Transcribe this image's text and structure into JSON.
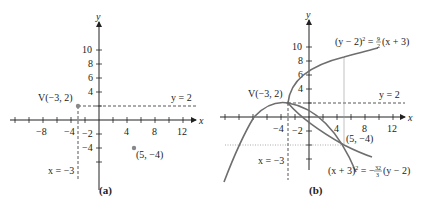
{
  "figure": {
    "panels": [
      {
        "id": "a",
        "caption": "(a)",
        "axis_x_label": "x",
        "axis_y_label": "y",
        "x_ticks": [
          "−8",
          "−4",
          "4",
          "8",
          "12"
        ],
        "y_ticks_pos": [
          "10",
          "8",
          "6",
          "4"
        ],
        "y_ticks_neg": [
          "−2",
          "−4"
        ],
        "vertex_label": "V(−3, 2)",
        "directrix_label": "y = 2",
        "axis_line_label": "x = −3",
        "point_label": "(5, −4)"
      },
      {
        "id": "b",
        "caption": "(b)",
        "axis_x_label": "x",
        "axis_y_label": "y",
        "x_ticks": [
          "−4",
          "4",
          "8",
          "12"
        ],
        "y_ticks_pos": [
          "10",
          "8",
          "6",
          "4"
        ],
        "y_ticks_neg": [
          "−2"
        ],
        "vertex_label": "V(−3, 2)",
        "directrix_label": "y = 2",
        "axis_line_label": "x = −3",
        "point_label": "(5, −4)",
        "eq1": {
          "lhs": "(y − 2)",
          "exp": "2",
          "eq": " = ",
          "num": "9",
          "den": "2",
          "rhs": "(x + 3)"
        },
        "eq2": {
          "lhs": "(x + 3)",
          "exp": "2",
          "eq": " = −",
          "num": "32",
          "den": "3",
          "rhs": "(y − 2)"
        }
      }
    ]
  },
  "colors": {
    "axis": "#222222",
    "curve": "#6e6e6e",
    "point": "#888888",
    "dashed": "#444444"
  }
}
